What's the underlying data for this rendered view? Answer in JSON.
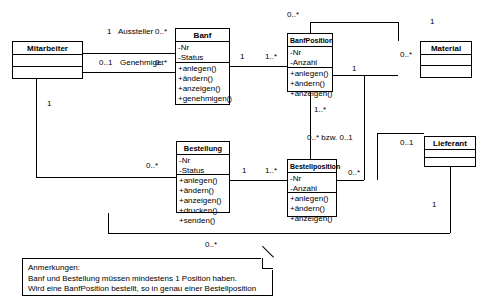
{
  "diagram": {
    "type": "uml-class-diagram",
    "language": "de",
    "classes": [
      {
        "id": "mitarbeiter",
        "name": "Mitarbeiter",
        "attributes": [],
        "operations": []
      },
      {
        "id": "banf",
        "name": "Banf",
        "attributes": [
          "-Nr",
          "-Status"
        ],
        "operations": [
          "+anlegen()",
          "+ändern()",
          "+anzeigen()",
          "+genehmigen()"
        ]
      },
      {
        "id": "banfposition",
        "name": "BanfPosition",
        "attributes": [
          "-Nr",
          "-Anzahl"
        ],
        "operations": [
          "+anlegen()",
          "+ändern()",
          "+anzeigen()"
        ]
      },
      {
        "id": "material",
        "name": "Material",
        "attributes": [],
        "operations": []
      },
      {
        "id": "bestellung",
        "name": "Bestellung",
        "attributes": [
          "-Nr",
          "-Status"
        ],
        "operations": [
          "+anlegen()",
          "+ändern()",
          "+anzeigen()",
          "+drucken()",
          "+senden()"
        ]
      },
      {
        "id": "bestellposition",
        "name": "Bestellposition",
        "attributes": [
          "-Nr",
          "-Anzahl"
        ],
        "operations": [
          "+anlegen()",
          "+ändern()",
          "+anzeigen()"
        ]
      },
      {
        "id": "lieferant",
        "name": "Lieferant",
        "attributes": [],
        "operations": []
      }
    ],
    "multiplicities": {
      "mitarbeiter_aussteller": "1",
      "role_aussteller": "Aussteller",
      "banf_aussteller": "0..*",
      "mitarbeiter_genehmiger": "0..1",
      "role_genehmiger": "Genehmiger",
      "banf_genehmiger": "0..*",
      "mitarbeiter_bestellung": "1",
      "bestellung_mitarbeiter": "0..*",
      "banf_to_pos": "1",
      "pos_to_banf": "1..*",
      "bestellung_to_pos": "1",
      "pos_to_bestellung": "1..*",
      "banfpos_material": "0..*",
      "material_banfpos": "1",
      "bestellpos_material": "1",
      "material_bestellpos": "0..*",
      "banfpos_bestellpos_upper": "1..*",
      "banfpos_bestellpos_lower": "0..* bzw. 0..1",
      "bestellpos_lieferant": "0..1",
      "lieferant_bestellung": "1",
      "bestellung_lieferant": "0..*"
    },
    "note": {
      "title": "Anmerkungen:",
      "lines": [
        "Banf und Bestellung müssen mindestens 1 Position haben.",
        "Wird eine BanfPosition bestellt, so in genau einer Bestellposition"
      ]
    },
    "colors": {
      "stroke": "#000000",
      "fill": "#ffffff"
    }
  }
}
